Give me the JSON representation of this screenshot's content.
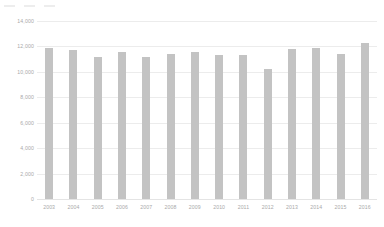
{
  "chart_data": {
    "type": "bar",
    "title": "",
    "subtitle": "",
    "xlabel": "",
    "ylabel": "",
    "categories": [
      "2003",
      "2004",
      "2005",
      "2006",
      "2007",
      "2008",
      "2009",
      "2010",
      "2011",
      "2012",
      "2013",
      "2014",
      "2015",
      "2016"
    ],
    "values": [
      11900,
      11700,
      11200,
      11550,
      11200,
      11400,
      11550,
      11300,
      11300,
      10200,
      11800,
      11900,
      11400,
      12300
    ],
    "series": [
      {
        "name": "Series 1",
        "values": [
          11900,
          11700,
          11200,
          11550,
          11200,
          11400,
          11550,
          11300,
          11300,
          10200,
          11800,
          11900,
          11400,
          12300
        ]
      }
    ],
    "ylim": [
      0,
      14000
    ],
    "y_ticks": [
      0,
      2000,
      4000,
      6000,
      8000,
      10000,
      12000,
      14000
    ],
    "y_tick_labels": [
      "0",
      "2,000",
      "4,000",
      "6,000",
      "8,000",
      "10,000",
      "12,000",
      "14,000"
    ],
    "grid": true,
    "legend": false,
    "legend_position": "none",
    "bar_color": "#c3c3c3",
    "gridline_color": "#ececec",
    "axis_text_color": "#a9a9a9",
    "background_color": "#ffffff"
  },
  "artifacts": {
    "top_marks": [
      "",
      "",
      ""
    ]
  }
}
